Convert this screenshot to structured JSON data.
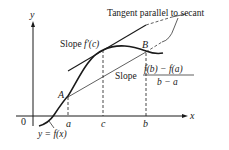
{
  "diagram": {
    "axes": {
      "x_label": "x",
      "y_label": "y",
      "origin_label": "0"
    },
    "curve_label": "y = f(x)",
    "points": {
      "A": "A",
      "B": "B"
    },
    "tick_labels": {
      "a": "a",
      "c": "c",
      "b": "b"
    },
    "annotations": {
      "tangent_callout": "Tangent parallel to secant",
      "tangent_slope_prefix": "Slope ",
      "tangent_slope_expr": "f′(c)",
      "secant_slope_prefix": "Slope",
      "secant_slope_numerator": "f(b) − f(a)",
      "secant_slope_denominator": "b − a"
    },
    "colors": {
      "ink": "#1a1a1a",
      "background": "#ffffff"
    }
  }
}
